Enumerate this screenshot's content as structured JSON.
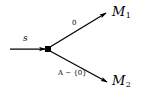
{
  "diagram": {
    "type": "state-transition-branch",
    "background_color": "#ffffff",
    "stroke_color": "#000000",
    "source": {
      "label": "s",
      "description": "incoming-arrow-source-state"
    },
    "vertex": {
      "shape": "filled-square",
      "x": 48,
      "y": 49
    },
    "targets": [
      {
        "id": "M1",
        "name": "M",
        "subscript": "1",
        "edge_label": "0",
        "position": "upper-right"
      },
      {
        "id": "M2",
        "name": "M",
        "subscript": "2",
        "edge_label_variable": "A",
        "edge_label_operator": "−",
        "edge_label_set": "{0}",
        "position": "lower-right"
      }
    ]
  }
}
